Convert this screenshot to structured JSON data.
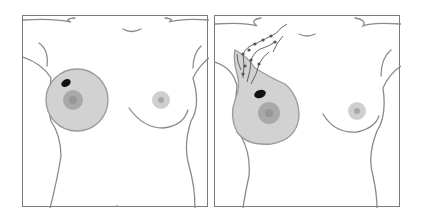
{
  "figure": {
    "panels": [
      {
        "id": "panel-left",
        "depiction": "torso with enlarged circular right breast containing dark lump",
        "colors": {
          "outline": "#8a8a8a",
          "breast_fill": "#d2d2d2",
          "areola": "#a9a9a9",
          "nipple": "#979797",
          "lump": "#111111"
        }
      },
      {
        "id": "panel-right",
        "depiction": "torso with enlarged right breast, dark lump, and lymph vessels spreading to armpit",
        "colors": {
          "outline": "#8a8a8a",
          "breast_fill": "#d2d2d2",
          "areola": "#a9a9a9",
          "nipple": "#979797",
          "lump": "#111111",
          "lymph": "#555555"
        }
      }
    ],
    "frame_color": "#7a7a7a",
    "background": "#ffffff"
  }
}
